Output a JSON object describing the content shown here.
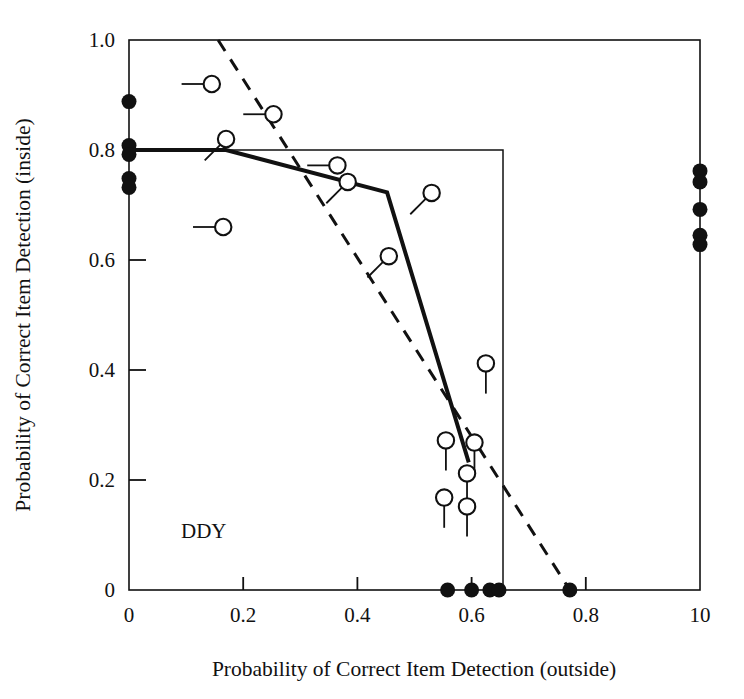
{
  "chart_data": {
    "type": "scatter",
    "title": "",
    "panel_label": "DDY",
    "xlabel": "Probability of Correct Item Detection (outside)",
    "ylabel": "Probability of Correct Item Detection (inside)",
    "xlim": [
      0,
      1.0
    ],
    "ylim": [
      0,
      1.0
    ],
    "grid": false,
    "legend": "none",
    "xticks": [
      0,
      0.2,
      0.4,
      0.6,
      0.8,
      1.0
    ],
    "xtick_labels": [
      "0",
      "0.2",
      "0.4",
      "0.6",
      "0.8",
      "10"
    ],
    "yticks": [
      0,
      0.2,
      0.4,
      0.6,
      0.8,
      1.0
    ],
    "ytick_labels": [
      "0",
      "0.2",
      "0.4",
      "0.6",
      "0.8",
      "1.0"
    ],
    "series": [
      {
        "name": "open-circles-with-stem",
        "marker": "open-circle",
        "points": [
          {
            "x": 0.145,
            "y": 0.92,
            "stem": "left"
          },
          {
            "x": 0.253,
            "y": 0.865,
            "stem": "left"
          },
          {
            "x": 0.17,
            "y": 0.82,
            "stem": "down-left"
          },
          {
            "x": 0.365,
            "y": 0.772,
            "stem": "left"
          },
          {
            "x": 0.383,
            "y": 0.742,
            "stem": "down-left"
          },
          {
            "x": 0.53,
            "y": 0.722,
            "stem": "down-left"
          },
          {
            "x": 0.165,
            "y": 0.66,
            "stem": "left"
          },
          {
            "x": 0.455,
            "y": 0.607,
            "stem": "down-left"
          },
          {
            "x": 0.625,
            "y": 0.412,
            "stem": "down"
          },
          {
            "x": 0.555,
            "y": 0.272,
            "stem": "down"
          },
          {
            "x": 0.605,
            "y": 0.268,
            "stem": "down"
          },
          {
            "x": 0.592,
            "y": 0.212,
            "stem": "down"
          },
          {
            "x": 0.552,
            "y": 0.168,
            "stem": "down"
          },
          {
            "x": 0.592,
            "y": 0.152,
            "stem": "down"
          }
        ]
      },
      {
        "name": "filled-circles-left-edge",
        "marker": "filled-circle",
        "points": [
          {
            "x": 0.0,
            "y": 0.888
          },
          {
            "x": 0.0,
            "y": 0.808
          },
          {
            "x": 0.0,
            "y": 0.792
          },
          {
            "x": 0.0,
            "y": 0.748
          },
          {
            "x": 0.0,
            "y": 0.732
          }
        ]
      },
      {
        "name": "filled-circles-right-edge",
        "marker": "filled-circle",
        "points": [
          {
            "x": 1.0,
            "y": 0.762
          },
          {
            "x": 1.0,
            "y": 0.742
          },
          {
            "x": 1.0,
            "y": 0.692
          },
          {
            "x": 1.0,
            "y": 0.645
          },
          {
            "x": 1.0,
            "y": 0.628
          }
        ]
      },
      {
        "name": "filled-circles-bottom-edge",
        "marker": "filled-circle",
        "points": [
          {
            "x": 0.558,
            "y": 0.0
          },
          {
            "x": 0.6,
            "y": 0.0
          },
          {
            "x": 0.632,
            "y": 0.0
          },
          {
            "x": 0.648,
            "y": 0.0
          },
          {
            "x": 0.772,
            "y": 0.0
          }
        ]
      }
    ],
    "lines": [
      {
        "name": "fitted-solid-line",
        "style": "solid",
        "width": 4,
        "points": [
          {
            "x": 0.0,
            "y": 0.8
          },
          {
            "x": 0.17,
            "y": 0.8
          },
          {
            "x": 0.452,
            "y": 0.723
          },
          {
            "x": 0.595,
            "y": 0.232
          }
        ]
      },
      {
        "name": "reference-dashed-line",
        "style": "dashed",
        "width": 3,
        "points": [
          {
            "x": 0.156,
            "y": 1.0
          },
          {
            "x": 0.772,
            "y": 0.0
          }
        ]
      }
    ],
    "shapes": [
      {
        "name": "inner-step-rectangle",
        "style": "solid",
        "width": 1.5,
        "points": [
          {
            "x": 0.0,
            "y": 0.8
          },
          {
            "x": 0.655,
            "y": 0.8
          },
          {
            "x": 0.655,
            "y": 0.0
          }
        ]
      }
    ]
  }
}
